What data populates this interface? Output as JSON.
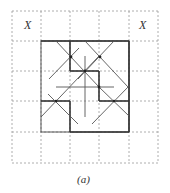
{
  "figure": {
    "caption": "(a)",
    "corner_labels": [
      "X",
      "X"
    ],
    "grid": {
      "lines_x": [
        12,
        41,
        70,
        99,
        129,
        158
      ],
      "lines_y": [
        11,
        41,
        71,
        101,
        132,
        163
      ],
      "style": "dashed",
      "color": "#9a9a9a"
    },
    "stroke_color": "#3a3a3a"
  }
}
